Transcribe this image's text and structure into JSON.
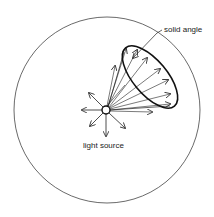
{
  "diagram": {
    "labels": {
      "solid_angle": "solid angle",
      "light_source": "light source"
    },
    "colors": {
      "background": "#ffffff",
      "stroke": "#222222"
    },
    "elements": {
      "sphere": {
        "cx": 107,
        "cy": 110,
        "r": 93
      },
      "light_source": {
        "cx": 106,
        "cy": 110,
        "r": 4
      },
      "solid_angle_ellipse": {
        "cx": 150,
        "cy": 77,
        "rx": 17,
        "ry": 38,
        "rotation": -40
      }
    }
  }
}
